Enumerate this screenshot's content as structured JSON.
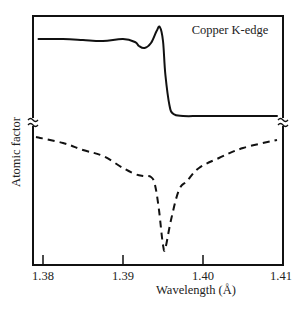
{
  "chart_data": {
    "type": "line",
    "title": "",
    "annotation": "Copper K-edge",
    "xlabel": "Wavelength (Å)",
    "ylabel": "Atomic factor",
    "xlim": [
      1.3788,
      1.41
    ],
    "x_ticks": [
      1.38,
      1.39,
      1.4,
      1.41
    ],
    "x_tick_labels": [
      "1.38",
      "1.39",
      "1.40",
      "1.41"
    ],
    "y_ticks": [],
    "y_units": "arbitrary (relative height, axis broken)",
    "grid": false,
    "legend": null,
    "axis_break": true,
    "series": [
      {
        "name": "upper (solid)",
        "style": "solid",
        "x": [
          1.37944,
          1.3825,
          1.385,
          1.3875,
          1.39,
          1.3915,
          1.392,
          1.3927,
          1.3935,
          1.3942,
          1.3946,
          1.395,
          1.3953,
          1.3958,
          1.3963,
          1.3975,
          1.4,
          1.405,
          1.40925
        ],
        "y": [
          226,
          226,
          225,
          224,
          226,
          223,
          219,
          217,
          222,
          234,
          238,
          224,
          190,
          160,
          151,
          149,
          149,
          149,
          149
        ]
      },
      {
        "name": "lower (dashed)",
        "style": "dashed",
        "x": [
          1.37912,
          1.3825,
          1.385,
          1.3875,
          1.39,
          1.3915,
          1.3925,
          1.3935,
          1.394,
          1.3945,
          1.395,
          1.3953,
          1.396,
          1.397,
          1.398,
          1.3995,
          1.402,
          1.405,
          1.40925
        ],
        "y": [
          128,
          122,
          115,
          109,
          97,
          91,
          89,
          88,
          80,
          55,
          20,
          17,
          45,
          75,
          84,
          97,
          107,
          117,
          125
        ]
      }
    ]
  }
}
